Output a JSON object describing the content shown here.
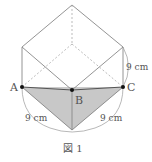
{
  "figure": {
    "caption": "図 1",
    "colors": {
      "line": "#888888",
      "dashed": "#aaaaaa",
      "fill": "#cccccc",
      "point": "#111111",
      "text": "#555555"
    },
    "points": {
      "A": {
        "label": "A",
        "x": 22,
        "y": 87
      },
      "B": {
        "label": "B",
        "x": 72,
        "y": 90
      },
      "C": {
        "label": "C",
        "x": 123,
        "y": 87
      }
    },
    "measurements": {
      "right_edge": "9 cm",
      "left_lower": "9 cm",
      "right_lower": "9 cm"
    }
  }
}
